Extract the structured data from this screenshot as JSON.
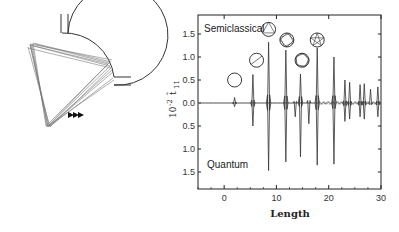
{
  "chart_data": {
    "type": "line",
    "title": "",
    "xlabel": "Length",
    "ylabel_prefix": "10",
    "ylabel_exp": "-2",
    "ylabel_symbol": "t̂",
    "ylabel_sub": "11",
    "xlim": [
      -5,
      30
    ],
    "ylim": [
      -1.9,
      1.9
    ],
    "x_ticks": [
      0,
      10,
      20,
      30
    ],
    "x_tick_labels": [
      "0",
      "10",
      "20",
      "30"
    ],
    "y_ticks": [
      1.5,
      1.0,
      0.5,
      0.0,
      -0.5,
      -1.0,
      -1.5
    ],
    "y_tick_labels": [
      "1.5",
      "1.0",
      "0.5",
      "0.0",
      "0.5",
      "1.0",
      "1.5"
    ],
    "grid": false,
    "annotations": [
      {
        "text": "Semiclassical",
        "position": "top-left"
      },
      {
        "text": "Quantum",
        "position": "bottom-left"
      }
    ],
    "series": [
      {
        "name": "Semiclassical",
        "direction": "up",
        "peaks": [
          {
            "x": 2.0,
            "y": 0.12
          },
          {
            "x": 5.5,
            "y": 0.62
          },
          {
            "x": 8.5,
            "y": 1.32
          },
          {
            "x": 11.8,
            "y": 1.15
          },
          {
            "x": 14.6,
            "y": 0.63
          },
          {
            "x": 17.8,
            "y": 1.2
          },
          {
            "x": 21.0,
            "y": 1.0
          },
          {
            "x": 23.1,
            "y": 0.5
          },
          {
            "x": 24.0,
            "y": 0.45
          },
          {
            "x": 26.0,
            "y": 0.4
          },
          {
            "x": 26.8,
            "y": 0.42
          },
          {
            "x": 28.0,
            "y": 0.3
          },
          {
            "x": 29.4,
            "y": 0.35
          }
        ]
      },
      {
        "name": "Quantum",
        "direction": "down",
        "peaks": [
          {
            "x": 2.0,
            "y": -0.08
          },
          {
            "x": 5.5,
            "y": -0.5
          },
          {
            "x": 8.5,
            "y": -1.47
          },
          {
            "x": 11.8,
            "y": -1.28
          },
          {
            "x": 13.6,
            "y": -0.3
          },
          {
            "x": 14.6,
            "y": -1.17
          },
          {
            "x": 16.2,
            "y": -0.45
          },
          {
            "x": 17.8,
            "y": -1.35
          },
          {
            "x": 21.0,
            "y": -1.33
          },
          {
            "x": 23.1,
            "y": -0.4
          },
          {
            "x": 24.0,
            "y": -0.35
          },
          {
            "x": 26.0,
            "y": -0.3
          },
          {
            "x": 26.8,
            "y": -0.35
          },
          {
            "x": 29.4,
            "y": -0.3
          }
        ]
      }
    ],
    "orbit_icons": [
      {
        "x": 2.0,
        "y": 0.5,
        "kind": "circle"
      },
      {
        "x": 6.2,
        "y": 0.93,
        "kind": "diameter"
      },
      {
        "x": 8.5,
        "y": 1.6,
        "kind": "triangle"
      },
      {
        "x": 12.0,
        "y": 1.37,
        "kind": "square"
      },
      {
        "x": 14.9,
        "y": 0.93,
        "kind": "pentagon"
      },
      {
        "x": 17.8,
        "y": 1.37,
        "kind": "star"
      }
    ]
  },
  "billiard": {
    "label": "circular billiard with two leads",
    "arrow_count": 3
  }
}
